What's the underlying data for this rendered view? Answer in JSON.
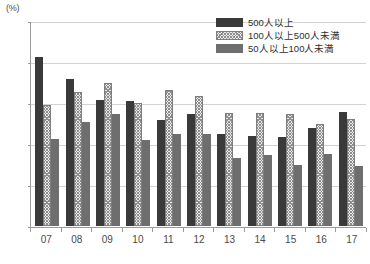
{
  "chart_data": {
    "type": "bar",
    "title": "",
    "xlabel": "",
    "ylabel": "(%)",
    "y_unit_label": "(%)",
    "ylim": [
      65,
      90
    ],
    "y_ticks": [
      65,
      70,
      75,
      80,
      85,
      90
    ],
    "grid": true,
    "legend_position": "top-right",
    "categories": [
      "07",
      "08",
      "09",
      "10",
      "11",
      "12",
      "13",
      "14",
      "15",
      "16",
      "17"
    ],
    "series": [
      {
        "name": "500人以上",
        "color": "#3a3a3a",
        "pattern": "solid-dark",
        "values": [
          85.6,
          82.9,
          80.4,
          80.2,
          77.9,
          78.6,
          76.2,
          76.0,
          75.9,
          76.9,
          78.9
        ]
      },
      {
        "name": "100人以上500人未満",
        "color": "#ececec",
        "pattern": "cross-hatch",
        "values": [
          79.7,
          81.4,
          82.5,
          80.0,
          81.6,
          80.8,
          78.8,
          78.8,
          78.7,
          77.4,
          78.0
        ]
      },
      {
        "name": "50人以上100人未満",
        "color": "#6e6e6e",
        "pattern": "solid-gray",
        "values": [
          75.6,
          77.7,
          78.7,
          75.5,
          76.2,
          76.2,
          73.3,
          73.6,
          72.4,
          73.8,
          72.3
        ]
      }
    ]
  }
}
